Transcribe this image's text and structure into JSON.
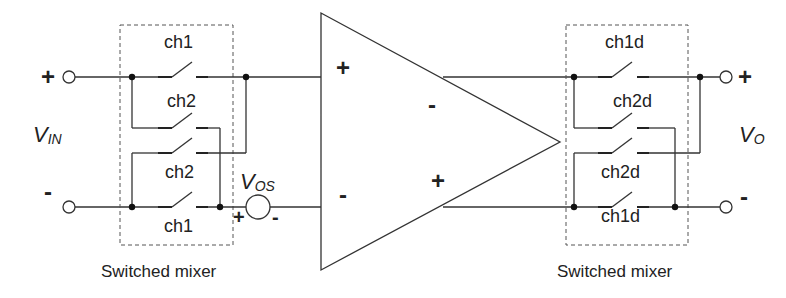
{
  "diagram": {
    "type": "circuit-schematic",
    "input": {
      "label_main": "V",
      "label_sub": "IN",
      "plus": "+",
      "minus": "-"
    },
    "output": {
      "label_main": "V",
      "label_sub": "O",
      "plus": "+",
      "minus": "-"
    },
    "offset_source": {
      "label_main": "V",
      "label_sub": "OS",
      "plus": "+",
      "minus": "-"
    },
    "amplifier": {
      "in_plus": "+",
      "in_minus": "-",
      "out_minus": "-",
      "out_plus": "+"
    },
    "left_mixer": {
      "caption": "Switched mixer",
      "switches": [
        "ch1",
        "ch2",
        "ch2",
        "ch1"
      ]
    },
    "right_mixer": {
      "caption": "Switched mixer",
      "switches": [
        "ch1d",
        "ch2d",
        "ch2d",
        "ch1d"
      ]
    }
  }
}
